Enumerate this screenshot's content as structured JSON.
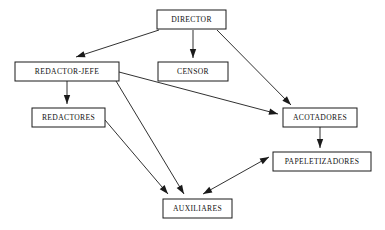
{
  "diagram": {
    "type": "organizational-flow-diagram",
    "background_color": "#ffffff",
    "line_color": "#1a1a1a",
    "text_color": "#111111",
    "box_fill": "#ffffff",
    "nodes": [
      {
        "id": "director",
        "label": "DIRECTOR",
        "x": 157,
        "y": 10,
        "width": 69,
        "height": 19
      },
      {
        "id": "redactor-jefe",
        "label": "REDACTOR-JEFE",
        "x": 15,
        "y": 62,
        "width": 104,
        "height": 19
      },
      {
        "id": "censor",
        "label": "CENSOR",
        "x": 158,
        "y": 62,
        "width": 70,
        "height": 19
      },
      {
        "id": "redactores",
        "label": "REDACTORES",
        "x": 32,
        "y": 108,
        "width": 73,
        "height": 19
      },
      {
        "id": "acotadores",
        "label": "ACOTADORES",
        "x": 283,
        "y": 108,
        "width": 74,
        "height": 19
      },
      {
        "id": "papeletizadores",
        "label": "PAPELETIZADORES",
        "x": 273,
        "y": 152,
        "width": 98,
        "height": 19
      },
      {
        "id": "auxiliares",
        "label": "AUXILIARES",
        "x": 163,
        "y": 199,
        "width": 69,
        "height": 19
      }
    ],
    "edges": [
      {
        "id": "director-to-redactor-jefe",
        "from": "director",
        "to": "redactor-jefe",
        "x1": 159,
        "y1": 30,
        "x2": 76,
        "y2": 57,
        "arrow_at": "end",
        "bidirectional": false
      },
      {
        "id": "director-to-censor",
        "from": "director",
        "to": "censor",
        "x1": 193,
        "y1": 30,
        "x2": 193,
        "y2": 58,
        "arrow_at": "end",
        "bidirectional": false
      },
      {
        "id": "director-to-acotadores",
        "from": "director",
        "to": "acotadores",
        "x1": 217,
        "y1": 30,
        "x2": 291,
        "y2": 105,
        "arrow_at": "end",
        "bidirectional": false
      },
      {
        "id": "redactor-jefe-to-redactores",
        "from": "redactor-jefe",
        "to": "redactores",
        "x1": 67,
        "y1": 81,
        "x2": 67,
        "y2": 104,
        "arrow_at": "end",
        "bidirectional": false
      },
      {
        "id": "redactor-jefe-to-acotadores",
        "from": "redactor-jefe",
        "to": "acotadores",
        "x1": 119,
        "y1": 72,
        "x2": 278,
        "y2": 114,
        "arrow_at": "end",
        "bidirectional": false
      },
      {
        "id": "redactor-jefe-to-auxiliares",
        "from": "redactor-jefe",
        "to": "auxiliares",
        "x1": 116,
        "y1": 81,
        "x2": 184,
        "y2": 194,
        "arrow_at": "end",
        "bidirectional": false
      },
      {
        "id": "redactores-to-auxiliares",
        "from": "redactores",
        "to": "auxiliares",
        "x1": 105,
        "y1": 120,
        "x2": 168,
        "y2": 194,
        "arrow_at": "end",
        "bidirectional": false
      },
      {
        "id": "acotadores-to-papeletizadores",
        "from": "acotadores",
        "to": "papeletizadores",
        "x1": 320,
        "y1": 127,
        "x2": 320,
        "y2": 148,
        "arrow_at": "end",
        "bidirectional": false
      },
      {
        "id": "papeletizadores-auxiliares",
        "from": "papeletizadores",
        "to": "auxiliares",
        "x1": 269,
        "y1": 157,
        "x2": 203,
        "y2": 194,
        "arrow_at": "both",
        "bidirectional": true
      }
    ]
  }
}
